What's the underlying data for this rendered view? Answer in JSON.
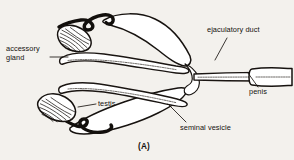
{
  "figure": {
    "caption": "(A)",
    "style": "line drawing",
    "colors": {
      "ink": "#16120f",
      "paper": "#f3f1ed",
      "organ_fill": "#ffffff"
    }
  },
  "labels": {
    "accessory_gland": {
      "line1": "accessory",
      "line2": "gland"
    },
    "ejaculatory_duct": "ejaculatory duct",
    "penis": "penis",
    "testis": "testis",
    "seminal_vesicle": "seminal vesicle"
  },
  "parts": [
    {
      "name": "accessory-gland-upper",
      "label": "accessory gland"
    },
    {
      "name": "accessory-gland-duct-upper",
      "label": "accessory gland duct"
    },
    {
      "name": "seminal-vesicle-upper",
      "label": "seminal vesicle"
    },
    {
      "name": "vas-deferens-upper",
      "label": "vas deferens"
    },
    {
      "name": "testis-lower",
      "label": "testis"
    },
    {
      "name": "vas-deferens-lower",
      "label": "vas deferens"
    },
    {
      "name": "seminal-vesicle-lower",
      "label": "seminal vesicle"
    },
    {
      "name": "ejaculatory-duct",
      "label": "ejaculatory duct"
    },
    {
      "name": "penis",
      "label": "penis"
    }
  ]
}
